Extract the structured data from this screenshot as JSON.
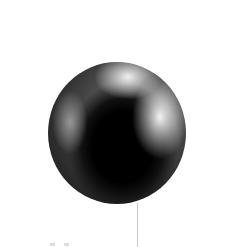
{
  "image": {
    "subject": "grayscale sphere",
    "colors": {
      "background": "#ffffff",
      "dark": "#000000",
      "highlight": "#f5f5f5",
      "line": "#c8c8c8"
    }
  }
}
